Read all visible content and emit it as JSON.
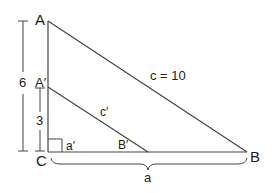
{
  "diagram": {
    "colors": {
      "stroke": "#444444",
      "text": "#222222",
      "background": "#ffffff"
    },
    "vertices": {
      "A": {
        "label": "A"
      },
      "A_prime": {
        "label": "A′"
      },
      "B": {
        "label": "B"
      },
      "B_prime": {
        "label": "B′"
      },
      "C": {
        "label": "C"
      }
    },
    "sides": {
      "hypotenuse_large": {
        "label": "c = 10"
      },
      "hypotenuse_small": {
        "label": "c′"
      },
      "base_small": {
        "label": "a′"
      },
      "base_large": {
        "label": "a"
      }
    },
    "dimensions": {
      "height_large": {
        "label": "6"
      },
      "height_small": {
        "label": "3"
      }
    }
  }
}
